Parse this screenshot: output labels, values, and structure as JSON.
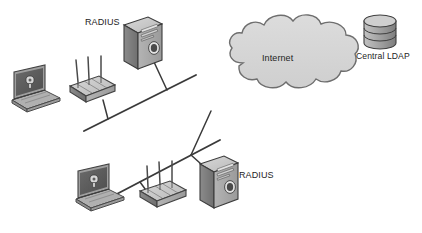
{
  "diagram": {
    "type": "network-topology",
    "title": "",
    "background_color": "#ffffff",
    "style": "grayscale isometric network diagram",
    "nodes": [
      {
        "id": "laptop-top",
        "icon": "laptop-icon",
        "label": "",
        "segment": "upper"
      },
      {
        "id": "ap-top",
        "icon": "wireless-access-point-icon",
        "label": "",
        "antennas": 3,
        "segment": "upper"
      },
      {
        "id": "server-top",
        "icon": "server-tower-icon",
        "label": "RADIUS",
        "segment": "upper"
      },
      {
        "id": "laptop-bottom",
        "icon": "laptop-icon",
        "label": "",
        "segment": "lower"
      },
      {
        "id": "ap-bottom",
        "icon": "wireless-access-point-icon",
        "label": "",
        "antennas": 3,
        "segment": "lower"
      },
      {
        "id": "server-bottom",
        "icon": "server-tower-icon",
        "label": "RADIUS",
        "segment": "lower"
      },
      {
        "id": "internet-cloud",
        "icon": "cloud-icon",
        "label": "Internet"
      },
      {
        "id": "central-ldap",
        "icon": "database-cylinder-icon",
        "label": "Central LDAP"
      }
    ],
    "labels": {
      "radius_top": "RADIUS",
      "radius_bottom": "RADIUS",
      "internet": "Internet",
      "central_ldap": "Central LDAP"
    },
    "links": [
      {
        "from": "backbone-upper",
        "to": "ap-top",
        "kind": "drop-line"
      },
      {
        "from": "backbone-upper",
        "to": "server-top",
        "kind": "drop-line"
      },
      {
        "from": "backbone-lower",
        "to": "ap-bottom",
        "kind": "drop-line"
      },
      {
        "from": "backbone-lower",
        "to": "server-bottom",
        "kind": "drop-line"
      },
      {
        "from": "backbone-upper",
        "to": "backbone-lower",
        "kind": "bus-segment"
      }
    ],
    "colors": {
      "line": "#3a3a3a",
      "cloud_fill": "#d4d4d4",
      "cloud_stroke": "#6e6e6e",
      "device_light": "#c9c9c9",
      "device_mid": "#a8a8a8",
      "device_dark": "#6f6f6f",
      "screen_dark": "#5b5b5b",
      "text": "#242424"
    }
  }
}
